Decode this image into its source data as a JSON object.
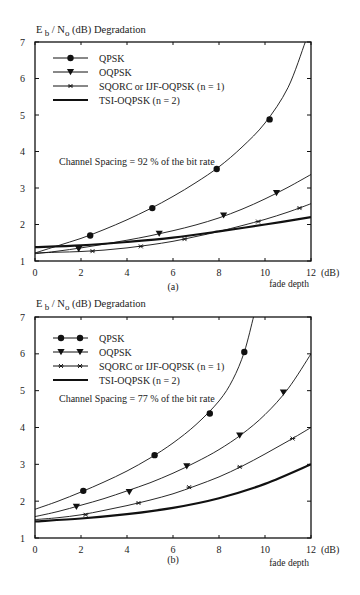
{
  "chart_data": [
    {
      "type": "line",
      "panel_label": "(a)",
      "ylabel": "E_b / N_o  (dB)  Degradation",
      "ylabel_parts": {
        "E": "E",
        "b": "b",
        "slash": " / N",
        "o": "o",
        "rest": "(dB)  Degradation"
      },
      "xlabel": "fade depth",
      "xunit": "(dB)",
      "xlim": [
        0,
        12
      ],
      "ylim": [
        1,
        7
      ],
      "xticks": [
        0,
        2,
        4,
        6,
        8,
        10,
        12
      ],
      "yticks": [
        1,
        2,
        3,
        4,
        5,
        6,
        7
      ],
      "grid": false,
      "legend_position": "top-left",
      "annotation": "Channel Spacing = 92 % of the bit rate",
      "series": [
        {
          "name": "QPSK",
          "marker": "circle",
          "style": "thin",
          "curve": [
            [
              0,
              1.22
            ],
            [
              1,
              1.42
            ],
            [
              2,
              1.62
            ],
            [
              3,
              1.86
            ],
            [
              4,
              2.13
            ],
            [
              5,
              2.43
            ],
            [
              6,
              2.77
            ],
            [
              7,
              3.15
            ],
            [
              8,
              3.58
            ],
            [
              9,
              4.12
            ],
            [
              10,
              4.78
            ],
            [
              11,
              5.75
            ],
            [
              11.75,
              7.0
            ]
          ],
          "markers": [
            [
              2.4,
              1.7
            ],
            [
              5.1,
              2.45
            ],
            [
              7.9,
              3.52
            ],
            [
              10.2,
              4.88
            ]
          ]
        },
        {
          "name": "OQPSK",
          "marker": "triangle",
          "style": "thin",
          "curve": [
            [
              0,
              1.2
            ],
            [
              1,
              1.27
            ],
            [
              2,
              1.36
            ],
            [
              3,
              1.46
            ],
            [
              4,
              1.57
            ],
            [
              5,
              1.69
            ],
            [
              6,
              1.83
            ],
            [
              7,
              1.99
            ],
            [
              8,
              2.18
            ],
            [
              9,
              2.42
            ],
            [
              10,
              2.7
            ],
            [
              11,
              3.02
            ],
            [
              12,
              3.37
            ]
          ],
          "markers": [
            [
              1.9,
              1.33
            ],
            [
              5.4,
              1.75
            ],
            [
              8.2,
              2.25
            ],
            [
              10.5,
              2.86
            ]
          ]
        },
        {
          "name": "SQORC or IJF-OQPSK  (n = 1)",
          "marker": "star",
          "style": "thin",
          "curve": [
            [
              0,
              1.22
            ],
            [
              1,
              1.24
            ],
            [
              2,
              1.26
            ],
            [
              3,
              1.3
            ],
            [
              4,
              1.36
            ],
            [
              5,
              1.44
            ],
            [
              6,
              1.54
            ],
            [
              7,
              1.67
            ],
            [
              8,
              1.81
            ],
            [
              9,
              1.97
            ],
            [
              10,
              2.14
            ],
            [
              11,
              2.34
            ],
            [
              12,
              2.57
            ]
          ],
          "markers": [
            [
              2.5,
              1.27
            ],
            [
              4.6,
              1.4
            ],
            [
              6.5,
              1.6
            ],
            [
              9.7,
              2.08
            ],
            [
              11.5,
              2.45
            ]
          ]
        },
        {
          "name": "TSI-OQPSK  (n = 2)",
          "marker": "none",
          "style": "thick",
          "curve": [
            [
              0,
              1.38
            ],
            [
              2,
              1.43
            ],
            [
              4,
              1.52
            ],
            [
              6,
              1.64
            ],
            [
              8,
              1.81
            ],
            [
              10,
              2.0
            ],
            [
              12,
              2.2
            ]
          ],
          "markers": []
        }
      ]
    },
    {
      "type": "line",
      "panel_label": "(b)",
      "ylabel": "E_b / N_o  (dB)  Degradation",
      "ylabel_parts": {
        "E": "E",
        "b": "b",
        "slash": " / N",
        "o": "o",
        "rest": "(dB)  Degradation"
      },
      "xlabel": "fade depth",
      "xunit": "(dB)",
      "xlim": [
        0,
        12
      ],
      "ylim": [
        1,
        7
      ],
      "xticks": [
        0,
        2,
        4,
        6,
        8,
        10,
        12
      ],
      "yticks": [
        1,
        2,
        3,
        4,
        5,
        6,
        7
      ],
      "grid": false,
      "legend_position": "top-left",
      "annotation": "Channel Spacing = 77 % of the bit rate",
      "series": [
        {
          "name": "QPSK",
          "marker": "circle",
          "style": "thin",
          "curve": [
            [
              0,
              1.78
            ],
            [
              1,
              2.0
            ],
            [
              2,
              2.25
            ],
            [
              3,
              2.52
            ],
            [
              4,
              2.82
            ],
            [
              5,
              3.17
            ],
            [
              6,
              3.58
            ],
            [
              7,
              4.08
            ],
            [
              8,
              4.72
            ],
            [
              8.6,
              5.3
            ],
            [
              9.1,
              6.05
            ],
            [
              9.5,
              7.0
            ]
          ],
          "markers": [
            [
              2.1,
              2.28
            ],
            [
              5.2,
              3.25
            ],
            [
              7.6,
              4.38
            ],
            [
              9.1,
              6.05
            ]
          ]
        },
        {
          "name": "OQPSK",
          "marker": "triangle",
          "style": "thin",
          "curve": [
            [
              0,
              1.58
            ],
            [
              1,
              1.72
            ],
            [
              2,
              1.89
            ],
            [
              3,
              2.07
            ],
            [
              4,
              2.28
            ],
            [
              5,
              2.5
            ],
            [
              6,
              2.76
            ],
            [
              7,
              3.06
            ],
            [
              8,
              3.4
            ],
            [
              9,
              3.82
            ],
            [
              10,
              4.35
            ],
            [
              11,
              5.05
            ],
            [
              12,
              6.0
            ]
          ],
          "markers": [
            [
              1.8,
              1.85
            ],
            [
              4.1,
              2.25
            ],
            [
              6.6,
              2.95
            ],
            [
              8.9,
              3.78
            ],
            [
              10.8,
              4.95
            ]
          ]
        },
        {
          "name": "SQORC or IJF-OQPSK  (n = 1)",
          "marker": "star",
          "style": "thin",
          "curve": [
            [
              0,
              1.5
            ],
            [
              1,
              1.55
            ],
            [
              2,
              1.63
            ],
            [
              3,
              1.75
            ],
            [
              4,
              1.88
            ],
            [
              5,
              2.03
            ],
            [
              6,
              2.2
            ],
            [
              7,
              2.42
            ],
            [
              8,
              2.66
            ],
            [
              9,
              2.95
            ],
            [
              10,
              3.28
            ],
            [
              11,
              3.63
            ],
            [
              12,
              4.0
            ]
          ],
          "markers": [
            [
              2.2,
              1.63
            ],
            [
              4.5,
              1.95
            ],
            [
              6.7,
              2.38
            ],
            [
              8.9,
              2.93
            ],
            [
              11.2,
              3.7
            ]
          ]
        },
        {
          "name": "TSI-OQPSK  (n = 2)",
          "marker": "none",
          "style": "thick",
          "curve": [
            [
              0,
              1.45
            ],
            [
              2,
              1.53
            ],
            [
              4,
              1.65
            ],
            [
              6,
              1.82
            ],
            [
              8,
              2.08
            ],
            [
              10,
              2.47
            ],
            [
              12,
              3.0
            ]
          ],
          "markers": []
        }
      ]
    }
  ]
}
